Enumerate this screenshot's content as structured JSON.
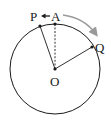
{
  "diagram": {
    "labels": {
      "P": "P",
      "A": "A",
      "Q": "Q",
      "O": "O"
    },
    "colors": {
      "stroke": "#1a1a1a",
      "arrow_gray": "#9a9a9a",
      "background": "#ffffff"
    },
    "circle": {
      "cx": 55,
      "cy": 69,
      "r": 45
    },
    "points": {
      "O": [
        55,
        69
      ],
      "A": [
        55,
        24
      ],
      "P": [
        40,
        26
      ],
      "Q": [
        92,
        47
      ]
    },
    "segments": [
      {
        "from": "O",
        "to": "A",
        "style": "dashed"
      },
      {
        "from": "O",
        "to": "P",
        "style": "solid"
      },
      {
        "from": "O",
        "to": "Q",
        "style": "solid"
      }
    ],
    "arrows": [
      {
        "from": "A",
        "to": "P",
        "style": "short-black"
      },
      {
        "from": "A",
        "to": "Q",
        "style": "curved-gray-outside"
      }
    ]
  }
}
